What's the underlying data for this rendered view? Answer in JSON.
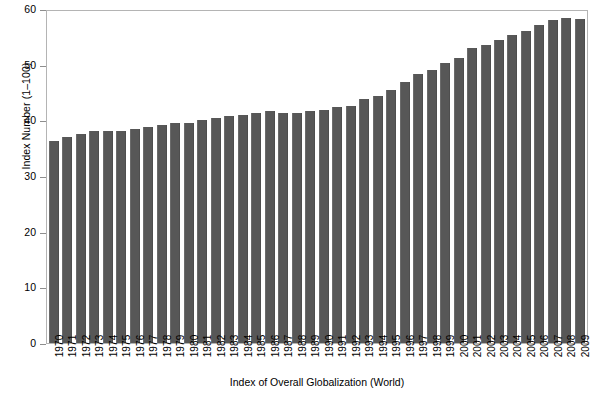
{
  "chart_data": {
    "type": "bar",
    "title": "",
    "subtitle": "",
    "xlabel": "Index of Overall Globalization (World)",
    "ylabel": "Index Number (1–100)",
    "ylim": [
      0,
      60
    ],
    "yticks": [
      0,
      10,
      20,
      30,
      40,
      50,
      60
    ],
    "grid": false,
    "legend": null,
    "bar_color": "#575757",
    "categories": [
      "1970",
      "1971",
      "1972",
      "1973",
      "1974",
      "1975",
      "1976",
      "1977",
      "1978",
      "1979",
      "1980",
      "1981",
      "1982",
      "1983",
      "1984",
      "1985",
      "1986",
      "1987",
      "1988",
      "1989",
      "1990",
      "1991",
      "1992",
      "1993",
      "1994",
      "1995",
      "1996",
      "1997",
      "1998",
      "1999",
      "2000",
      "2001",
      "2002",
      "2003",
      "2004",
      "2005",
      "2006",
      "2007",
      "2008",
      "2009"
    ],
    "values": [
      36.3,
      37.0,
      37.6,
      38.0,
      38.1,
      38.0,
      38.5,
      38.8,
      39.2,
      39.6,
      39.6,
      40.1,
      40.4,
      40.7,
      41.0,
      41.3,
      41.7,
      41.3,
      41.4,
      41.6,
      41.9,
      42.4,
      42.5,
      43.8,
      44.3,
      45.4,
      46.9,
      48.4,
      49.0,
      50.3,
      51.2,
      53.0,
      53.6,
      54.4,
      55.4,
      56.1,
      57.2,
      58.1,
      58.3,
      58.2
    ]
  },
  "axes": {
    "y_title": "Index Number (1–100)",
    "x_title": "Index of Overall Globalization (World)"
  }
}
